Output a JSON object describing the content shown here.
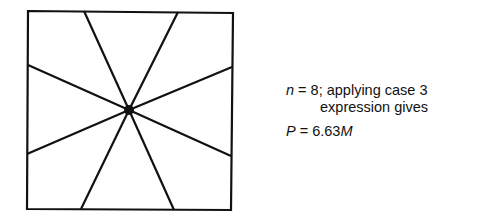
{
  "diagram": {
    "type": "square with 8 radial lines from interior point",
    "square": {
      "tl": [
        28,
        11
      ],
      "tr": [
        233,
        13
      ],
      "br": [
        231,
        210
      ],
      "bl": [
        27,
        209
      ]
    },
    "center": [
      129,
      110
    ],
    "rays": [
      [
        84,
        11
      ],
      [
        178,
        12
      ],
      [
        232,
        67
      ],
      [
        231,
        156
      ],
      [
        174,
        210
      ],
      [
        81,
        209
      ],
      [
        27,
        154
      ],
      [
        28,
        65
      ]
    ],
    "stroke_color": "#111111"
  },
  "annotation": {
    "line1_var": "n",
    "line1_rest": " = 8; applying case 3",
    "line2": "expression gives",
    "line3_var": "P",
    "line3_mid": " = 6.63",
    "line3_unit": "M"
  }
}
